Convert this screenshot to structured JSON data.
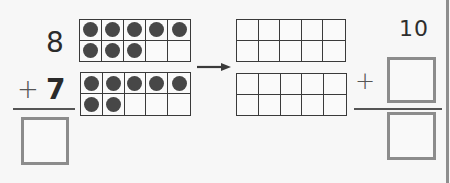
{
  "problem": {
    "addend1": "8",
    "operator": "+",
    "addend2": "7",
    "answer_box": ""
  },
  "ten_frames_left": [
    {
      "name": "ten-frame-eight",
      "filled": 8,
      "total": 10
    },
    {
      "name": "ten-frame-seven",
      "filled": 7,
      "total": 10
    }
  ],
  "ten_frames_right": [
    {
      "name": "ten-frame-empty-top",
      "filled": 0,
      "total": 10
    },
    {
      "name": "ten-frame-empty-bottom",
      "filled": 0,
      "total": 10
    }
  ],
  "arrow": {
    "icon": "right-arrow-icon"
  },
  "make_ten": {
    "addend1": "10",
    "operator": "+",
    "addend2_box": "",
    "sum_box": ""
  },
  "colors": {
    "dot": "#474747",
    "grid": "#3a3a3a",
    "box_border": "#8c8c8c",
    "background": "#f7f7f7"
  }
}
